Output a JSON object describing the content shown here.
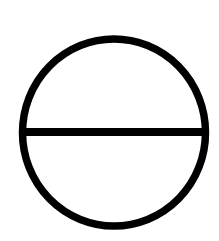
{
  "diagram": {
    "symbol": "circle-with-horizontal-diameter",
    "icon_name": "theta-circle-icon",
    "colors": {
      "background": "#ffffff",
      "stroke": "#000000"
    },
    "shape": {
      "cx": 114,
      "cy": 132.5,
      "rx": 91.5,
      "ry": 93.5,
      "stroke_width": 7.5
    },
    "diameter_line": {
      "x1": 22.5,
      "x2": 205.5,
      "y": 132,
      "stroke_width": 8
    }
  }
}
